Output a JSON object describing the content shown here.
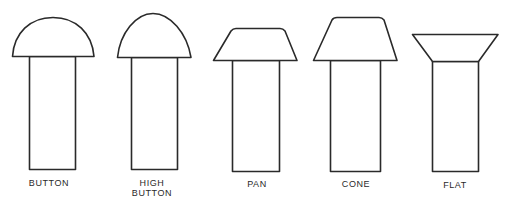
{
  "diagram": {
    "stroke_color": "#2a2a2a",
    "background": "#ffffff",
    "rivets": [
      {
        "id": "button",
        "label_lines": [
          "BUTTON"
        ],
        "head_shape": "dome"
      },
      {
        "id": "high-button",
        "label_lines": [
          "HIGH",
          "BUTTON"
        ],
        "head_shape": "high-dome"
      },
      {
        "id": "pan",
        "label_lines": [
          "PAN"
        ],
        "head_shape": "truncated-cone-low"
      },
      {
        "id": "cone",
        "label_lines": [
          "CONE"
        ],
        "head_shape": "truncated-cone"
      },
      {
        "id": "flat",
        "label_lines": [
          "FLAT"
        ],
        "head_shape": "countersunk"
      }
    ]
  }
}
